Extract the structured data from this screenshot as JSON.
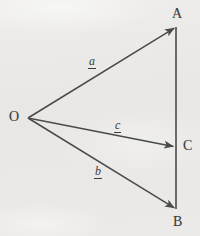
{
  "figure": {
    "kind": "vector-triangle-diagram",
    "width": 200,
    "height": 236,
    "background_color": "#e9e8e6",
    "ink_color": "#4a4a4a",
    "label_color": "#3b3b3b"
  },
  "points": [
    {
      "id": "O",
      "label": "O",
      "x": 28,
      "y": 118,
      "label_x": 9,
      "label_y": 110
    },
    {
      "id": "A",
      "label": "A",
      "x": 176,
      "y": 27,
      "label_x": 172,
      "label_y": 7
    },
    {
      "id": "C",
      "label": "C",
      "x": 176,
      "y": 147,
      "label_x": 183,
      "label_y": 139
    },
    {
      "id": "B",
      "label": "B",
      "x": 176,
      "y": 209,
      "label_x": 173,
      "label_y": 215
    }
  ],
  "vectors": [
    {
      "id": "a",
      "label": "a",
      "notation": "underbar",
      "from": "O",
      "to": "A",
      "x1": 28,
      "y1": 118,
      "x2": 176,
      "y2": 27,
      "label_x": 88,
      "label_y": 55
    },
    {
      "id": "c",
      "label": "c",
      "notation": "underbar",
      "from": "O",
      "to": "C",
      "x1": 28,
      "y1": 118,
      "x2": 176,
      "y2": 147,
      "label_x": 114,
      "label_y": 119
    },
    {
      "id": "b",
      "label": "b",
      "notation": "underbar",
      "from": "O",
      "to": "B",
      "x1": 28,
      "y1": 118,
      "x2": 176,
      "y2": 209,
      "label_x": 94,
      "label_y": 165
    }
  ],
  "segments": [
    {
      "id": "AB",
      "from": "A",
      "to": "B",
      "x1": 176,
      "y1": 27,
      "x2": 176,
      "y2": 209,
      "arrow": false
    }
  ]
}
